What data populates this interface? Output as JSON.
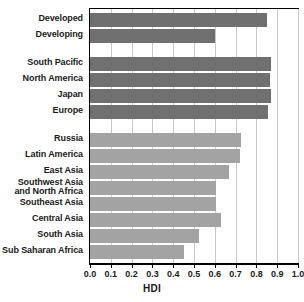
{
  "chart_data": {
    "type": "bar",
    "orientation": "horizontal",
    "title": "",
    "xlabel": "HDI",
    "ylabel": "",
    "xlim": [
      0.0,
      1.0
    ],
    "xticks": [
      "0.0",
      "0.1",
      "0.2",
      "0.3",
      "0.4",
      "0.5",
      "0.6",
      "0.7",
      "0.8",
      "0.9",
      "1.0"
    ],
    "grid": "vertical",
    "legend": "none",
    "colors": {
      "dark_bar": "#707070",
      "light_bar": "#a3a3a3",
      "gridline": "#c8c8c8",
      "axis": "#000000",
      "text": "#1a1a1a",
      "background": "#ffffff"
    },
    "groups": [
      {
        "name": "development-status",
        "color": "dark_bar",
        "items": [
          {
            "label": "Developed",
            "value": 0.85
          },
          {
            "label": "Developing",
            "value": 0.6
          }
        ]
      },
      {
        "name": "developed-regions",
        "color": "dark_bar",
        "items": [
          {
            "label": "South Pacific",
            "value": 0.87
          },
          {
            "label": "North America",
            "value": 0.865
          },
          {
            "label": "Japan",
            "value": 0.87
          },
          {
            "label": "Europe",
            "value": 0.855
          }
        ]
      },
      {
        "name": "developing-regions",
        "color": "light_bar",
        "items": [
          {
            "label": "Russia",
            "value": 0.725
          },
          {
            "label": "Latin America",
            "value": 0.72
          },
          {
            "label": "East Asia",
            "value": 0.67
          },
          {
            "label": "Southwest Asia\nand North Africa",
            "value": 0.605
          },
          {
            "label": "Southeast Asia",
            "value": 0.605
          },
          {
            "label": "Central Asia",
            "value": 0.63
          },
          {
            "label": "South Asia",
            "value": 0.525
          },
          {
            "label": "Sub Saharan Africa",
            "value": 0.45
          }
        ]
      }
    ],
    "categories": [
      "Developed",
      "Developing",
      "South Pacific",
      "North America",
      "Japan",
      "Europe",
      "Russia",
      "Latin America",
      "East Asia",
      "Southwest Asia and North Africa",
      "Southeast Asia",
      "Central Asia",
      "South Asia",
      "Sub Saharan Africa"
    ],
    "values": [
      0.85,
      0.6,
      0.87,
      0.865,
      0.87,
      0.855,
      0.725,
      0.72,
      0.67,
      0.605,
      0.605,
      0.63,
      0.525,
      0.45
    ]
  }
}
